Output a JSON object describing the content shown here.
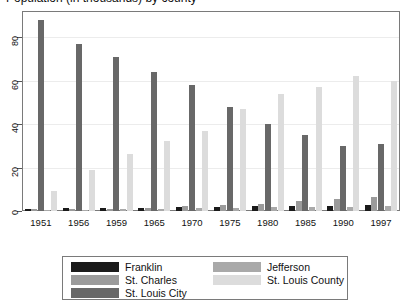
{
  "title": "Population (in thousands) by county",
  "chart_data": {
    "type": "bar",
    "title": "Population (in thousands) by county",
    "xlabel": "",
    "ylabel": "",
    "ylim": [
      0,
      92
    ],
    "yticks": [
      0,
      20,
      40,
      60,
      80
    ],
    "grid": true,
    "legend_position": "bottom",
    "categories": [
      "1951",
      "1956",
      "1959",
      "1965",
      "1970",
      "1975",
      "1980",
      "1985",
      "1990",
      "1997"
    ],
    "series": [
      {
        "name": "Franklin",
        "color": "#1a1a1a",
        "values": [
          1.0,
          1.2,
          1.4,
          1.5,
          2.0,
          2.0,
          2.2,
          2.3,
          2.5,
          2.7
        ]
      },
      {
        "name": "St. Charles",
        "color": "#9b9b9b",
        "values": [
          0.8,
          1.0,
          1.1,
          1.3,
          2.2,
          2.6,
          3.4,
          4.4,
          5.6,
          6.3
        ]
      },
      {
        "name": "St. Louis City",
        "color": "#686868",
        "values": [
          88.0,
          77.0,
          71.0,
          64.0,
          58.0,
          48.0,
          40.0,
          35.0,
          30.0,
          31.0
        ]
      },
      {
        "name": "Jefferson",
        "color": "#a9a9a9",
        "values": [
          0.5,
          0.6,
          0.8,
          0.9,
          1.2,
          1.4,
          1.7,
          1.9,
          2.0,
          2.2
        ]
      },
      {
        "name": "St. Louis County",
        "color": "#dcdcdc",
        "values": [
          9.0,
          19.0,
          26.0,
          32.0,
          37.0,
          47.0,
          54.0,
          57.0,
          62.0,
          60.0
        ]
      }
    ]
  },
  "legend": {
    "entries": [
      {
        "label": "Franklin",
        "color": "#1a1a1a"
      },
      {
        "label": "St. Charles",
        "color": "#9b9b9b"
      },
      {
        "label": "St. Louis City",
        "color": "#686868"
      },
      {
        "label": "Jefferson",
        "color": "#a9a9a9"
      },
      {
        "label": "St. Louis County",
        "color": "#dcdcdc"
      }
    ]
  }
}
